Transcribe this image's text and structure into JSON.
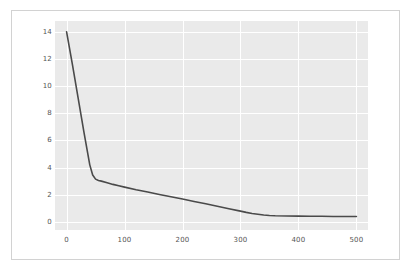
{
  "figure": {
    "background_color": "#ffffff",
    "frame_border_color": "#d2d2d2",
    "plot_background_color": "#eaeaea",
    "gridline_color": "#ffffff",
    "line_color": "#4a4a4a",
    "tick_label_color": "#555555"
  },
  "chart_data": {
    "type": "line",
    "title": "",
    "xlabel": "",
    "ylabel": "",
    "xlim": [
      -20,
      520
    ],
    "ylim": [
      -0.6,
      14.8
    ],
    "grid": true,
    "legend": null,
    "xticks": [
      0,
      100,
      200,
      300,
      400,
      500
    ],
    "yticks": [
      0,
      2,
      4,
      6,
      8,
      10,
      12,
      14
    ],
    "xtick_labels": [
      "0",
      "100",
      "200",
      "300",
      "400",
      "500"
    ],
    "ytick_labels": [
      "0",
      "2",
      "4",
      "6",
      "8",
      "10",
      "12",
      "14"
    ],
    "series": [
      {
        "name": "curve",
        "x": [
          0,
          10,
          20,
          30,
          40,
          45,
          50,
          55,
          60,
          70,
          80,
          90,
          100,
          120,
          140,
          160,
          180,
          200,
          220,
          240,
          260,
          280,
          300,
          310,
          320,
          330,
          340,
          350,
          360,
          380,
          400,
          420,
          440,
          460,
          480,
          500
        ],
        "y": [
          14.0,
          11.6,
          9.1,
          6.6,
          4.2,
          3.45,
          3.15,
          3.05,
          3.0,
          2.88,
          2.76,
          2.66,
          2.56,
          2.37,
          2.2,
          2.02,
          1.85,
          1.68,
          1.5,
          1.33,
          1.15,
          0.97,
          0.79,
          0.7,
          0.62,
          0.56,
          0.5,
          0.47,
          0.45,
          0.43,
          0.42,
          0.41,
          0.41,
          0.4,
          0.4,
          0.4
        ]
      }
    ]
  }
}
